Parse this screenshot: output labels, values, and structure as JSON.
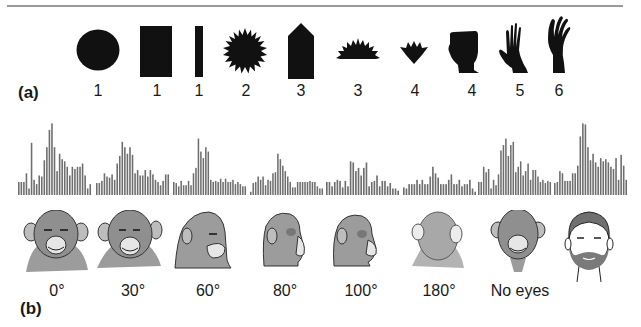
{
  "panel_a": {
    "label": "(a)",
    "shapes": [
      {
        "name": "circle",
        "number": "1"
      },
      {
        "name": "square",
        "number": "1"
      },
      {
        "name": "bar",
        "number": "1"
      },
      {
        "name": "star",
        "number": "2"
      },
      {
        "name": "pentagon-arrow",
        "number": "3"
      },
      {
        "name": "half-star",
        "number": "3"
      },
      {
        "name": "tulip",
        "number": "4"
      },
      {
        "name": "fist",
        "number": "4"
      },
      {
        "name": "hand",
        "number": "5"
      },
      {
        "name": "hand-spread",
        "number": "6"
      }
    ]
  },
  "panel_b": {
    "label": "(b)",
    "conditions": [
      {
        "label": "0°",
        "head": "chimp-frontal"
      },
      {
        "label": "30°",
        "head": "chimp-30"
      },
      {
        "label": "60°",
        "head": "chimp-60"
      },
      {
        "label": "80°",
        "head": "chimp-80"
      },
      {
        "label": "100°",
        "head": "chimp-100"
      },
      {
        "label": "180°",
        "head": "chimp-back"
      },
      {
        "label": "No eyes",
        "head": "chimp-no-eyes"
      },
      {
        "label": "",
        "head": "human-face"
      }
    ]
  },
  "colors": {
    "bar": "#6e6e6e",
    "shape": "#111111",
    "head_fill": "#9c9c9c",
    "rule": "#9a9a9a"
  },
  "chart_data": {
    "type": "bar",
    "title": "",
    "xlabel": "",
    "ylabel": "",
    "grid": false,
    "series": [
      {
        "name": "0°",
        "values": [
          12,
          12,
          12,
          20,
          6,
          48,
          14,
          10,
          18,
          17,
          32,
          44,
          60,
          66,
          44,
          22,
          38,
          33,
          31,
          26,
          18,
          26,
          24,
          26,
          26,
          29,
          18,
          6,
          10
        ]
      },
      {
        "name": "30°",
        "values": [
          11,
          11,
          13,
          20,
          17,
          16,
          19,
          14,
          29,
          36,
          49,
          44,
          38,
          44,
          37,
          20,
          23,
          18,
          18,
          23,
          17,
          23,
          19,
          14,
          12,
          9,
          13,
          19,
          19
        ]
      },
      {
        "name": "60°",
        "values": [
          12,
          11,
          8,
          13,
          9,
          9,
          13,
          9,
          20,
          25,
          52,
          40,
          34,
          44,
          40,
          14,
          12,
          13,
          12,
          15,
          12,
          15,
          12,
          12,
          14,
          10,
          12,
          10,
          8,
          8
        ]
      },
      {
        "name": "80°",
        "values": [
          3,
          11,
          12,
          17,
          14,
          17,
          9,
          14,
          13,
          20,
          21,
          38,
          33,
          27,
          22,
          17,
          12,
          7,
          7,
          12,
          12,
          12,
          12,
          12,
          13,
          12,
          12,
          8,
          6,
          6
        ]
      },
      {
        "name": "100°",
        "values": [
          12,
          12,
          8,
          12,
          14,
          13,
          7,
          13,
          8,
          31,
          30,
          22,
          25,
          18,
          25,
          30,
          8,
          12,
          13,
          18,
          8,
          13,
          13,
          8,
          11,
          6,
          6,
          4
        ]
      },
      {
        "name": "180°",
        "values": [
          7,
          6,
          10,
          10,
          10,
          14,
          10,
          14,
          10,
          10,
          17,
          26,
          20,
          16,
          10,
          10,
          10,
          14,
          19,
          10,
          10,
          14,
          8,
          10,
          10,
          14,
          6,
          3
        ]
      },
      {
        "name": "No eyes",
        "values": [
          12,
          12,
          26,
          21,
          24,
          6,
          14,
          9,
          19,
          41,
          46,
          52,
          36,
          46,
          49,
          21,
          26,
          31,
          18,
          22,
          29,
          14,
          23,
          23,
          17,
          12,
          14,
          11,
          13,
          12
        ]
      },
      {
        "name": "Human face",
        "values": [
          11,
          12,
          22,
          20,
          13,
          13,
          13,
          20,
          20,
          27,
          54,
          66,
          65,
          44,
          32,
          38,
          30,
          26,
          34,
          31,
          33,
          30,
          26,
          24,
          34,
          14,
          37,
          27,
          14
        ]
      }
    ],
    "ylim": [
      0,
      70
    ]
  }
}
